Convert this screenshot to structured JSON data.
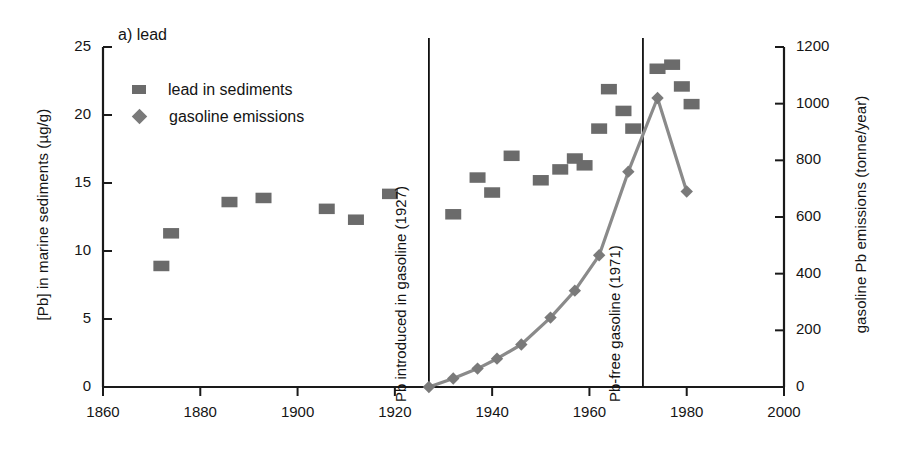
{
  "panel": {
    "title": "a) lead"
  },
  "chart_data": {
    "type": "scatter",
    "title": "a) lead",
    "xlabel": "",
    "ylabel": "[Pb] in marine sediments (µg/g)",
    "ylabel_right": "gasoline Pb emissions (tonne/year)",
    "xlim": [
      1860,
      2000
    ],
    "ylim": [
      0,
      25
    ],
    "ylim_right": [
      0,
      1200
    ],
    "xticks": [
      1860,
      1880,
      1900,
      1920,
      1940,
      1960,
      1980,
      2000
    ],
    "yticks": [
      0,
      5,
      10,
      15,
      20,
      25
    ],
    "yticks_right": [
      0,
      200,
      400,
      600,
      800,
      1000,
      1200
    ],
    "grid": false,
    "legend_position": "upper-left",
    "series": [
      {
        "name": "lead in sediments",
        "marker": "square",
        "color": "#6b6b6b",
        "axis": "left",
        "units": "µg/g",
        "points": [
          {
            "x": 1872,
            "y": 8.9
          },
          {
            "x": 1874,
            "y": 11.3
          },
          {
            "x": 1886,
            "y": 13.6
          },
          {
            "x": 1893,
            "y": 13.9
          },
          {
            "x": 1906,
            "y": 13.1
          },
          {
            "x": 1912,
            "y": 12.3
          },
          {
            "x": 1919,
            "y": 14.2
          },
          {
            "x": 1932,
            "y": 12.7
          },
          {
            "x": 1937,
            "y": 15.4
          },
          {
            "x": 1940,
            "y": 14.3
          },
          {
            "x": 1944,
            "y": 17.0
          },
          {
            "x": 1950,
            "y": 15.2
          },
          {
            "x": 1954,
            "y": 16.0
          },
          {
            "x": 1957,
            "y": 16.8
          },
          {
            "x": 1959,
            "y": 16.3
          },
          {
            "x": 1962,
            "y": 19.0
          },
          {
            "x": 1964,
            "y": 21.9
          },
          {
            "x": 1967,
            "y": 20.3
          },
          {
            "x": 1969,
            "y": 19.0
          },
          {
            "x": 1974,
            "y": 23.4
          },
          {
            "x": 1977,
            "y": 23.7
          },
          {
            "x": 1979,
            "y": 22.1
          },
          {
            "x": 1981,
            "y": 20.8
          }
        ]
      },
      {
        "name": "gasoline emissions",
        "marker": "diamond",
        "color": "#7a7a7a",
        "axis": "right",
        "units": "tonne/year",
        "line": true,
        "points": [
          {
            "x": 1927,
            "y": 0
          },
          {
            "x": 1932,
            "y": 30
          },
          {
            "x": 1937,
            "y": 65
          },
          {
            "x": 1941,
            "y": 100
          },
          {
            "x": 1946,
            "y": 150
          },
          {
            "x": 1952,
            "y": 245
          },
          {
            "x": 1957,
            "y": 340
          },
          {
            "x": 1962,
            "y": 465
          },
          {
            "x": 1968,
            "y": 760
          },
          {
            "x": 1974,
            "y": 1020
          },
          {
            "x": 1980,
            "y": 690
          }
        ]
      }
    ],
    "annotations": [
      {
        "text": "Pb introduced in gasoline (1927)",
        "x": 1927,
        "orientation": "vertical-line"
      },
      {
        "text": "Pb-free gasoline (1971)",
        "x": 1971,
        "orientation": "vertical-line"
      }
    ]
  },
  "legend": {
    "items": [
      {
        "label": "lead in sediments",
        "marker": "square"
      },
      {
        "label": "gasoline emissions",
        "marker": "diamond"
      }
    ]
  },
  "colors": {
    "marker_square": "#6b6b6b",
    "marker_diamond": "#7a7a7a",
    "line": "#8a8a8a",
    "axis": "#1a1a1a"
  }
}
